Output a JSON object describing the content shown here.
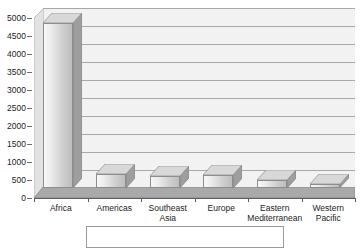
{
  "chart_data": {
    "type": "bar",
    "title": "",
    "subtitle": "",
    "xlabel": "",
    "ylabel": "",
    "categories": [
      "Africa",
      "Americas",
      "Southeast Asia",
      "Europe",
      "Eastern Mediterranean",
      "Western Pacific"
    ],
    "category_lines": [
      [
        "Africa"
      ],
      [
        "Americas"
      ],
      [
        "Southeast",
        "Asia"
      ],
      [
        "Europe"
      ],
      [
        "Eastern",
        "Mediterranean"
      ],
      [
        "Western",
        "Pacific"
      ]
    ],
    "values": [
      4580,
      390,
      330,
      370,
      230,
      100
    ],
    "series": [
      {
        "name": "",
        "values": [
          4580,
          390,
          330,
          370,
          230,
          100
        ]
      }
    ],
    "ylim": [
      0,
      5000
    ],
    "ytick_step": 500,
    "ytick_labels": [
      "5000",
      "4500",
      "4000",
      "3500",
      "3000",
      "2500",
      "2000",
      "1500",
      "1000",
      "500",
      "0"
    ],
    "ytick_values": [
      5000,
      4500,
      4000,
      3500,
      3000,
      2500,
      2000,
      1500,
      1000,
      500,
      0
    ],
    "grid": true,
    "grid_axis": "y",
    "legend": {
      "visible": true,
      "position": "bottom",
      "entries": []
    },
    "style": "3d-bar-grayscale",
    "colors": {
      "bar_face_light": "#f7f7f7",
      "bar_face_dark": "#bdbdbd",
      "bar_side": "#9e9e9e",
      "bar_top": "#d8d8d8",
      "bar_outline": "#8d8d8d",
      "plot_background": "#f2f2f2",
      "gridline": "#a8a8a8",
      "axis_line": "#5d5d5d",
      "floor": "#9a9a9a",
      "text": "#1c1c1c",
      "legend_border": "#9b9b9b"
    }
  }
}
